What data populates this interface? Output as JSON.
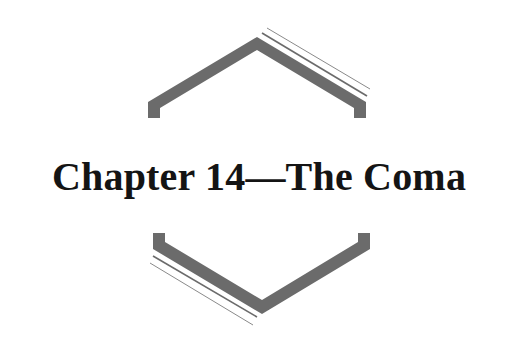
{
  "chapter": {
    "title": "Chapter 14—The Coma"
  },
  "ornament": {
    "top": "chevron-up-ornament",
    "bottom": "chevron-down-ornament",
    "color": "#6b6b6b",
    "line_color": "#7a7a7a"
  }
}
